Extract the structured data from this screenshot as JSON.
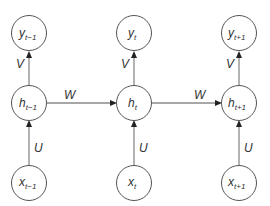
{
  "diagram": {
    "columns": [
      {
        "output": {
          "var": "y",
          "sub": "t−1"
        },
        "hidden": {
          "var": "h",
          "sub": "t−1"
        },
        "input": {
          "var": "x",
          "sub": "t−1"
        }
      },
      {
        "output": {
          "var": "y",
          "sub": "t"
        },
        "hidden": {
          "var": "h",
          "sub": "t"
        },
        "input": {
          "var": "x",
          "sub": "t"
        }
      },
      {
        "output": {
          "var": "y",
          "sub": "t+1"
        },
        "hidden": {
          "var": "h",
          "sub": "t+1"
        },
        "input": {
          "var": "x",
          "sub": "t+1"
        }
      }
    ],
    "edge_labels": {
      "input_to_hidden": "U",
      "hidden_to_output": "V",
      "hidden_to_hidden": "W"
    },
    "edges": [
      {
        "from": "x_t-1",
        "to": "h_t-1",
        "label": "U"
      },
      {
        "from": "h_t-1",
        "to": "y_t-1",
        "label": "V"
      },
      {
        "from": "x_t",
        "to": "h_t",
        "label": "U"
      },
      {
        "from": "h_t",
        "to": "y_t",
        "label": "V"
      },
      {
        "from": "x_t+1",
        "to": "h_t+1",
        "label": "U"
      },
      {
        "from": "h_t+1",
        "to": "y_t+1",
        "label": "V"
      },
      {
        "from": "h_t-1",
        "to": "h_t",
        "label": "W"
      },
      {
        "from": "h_t",
        "to": "h_t+1",
        "label": "W"
      }
    ]
  }
}
